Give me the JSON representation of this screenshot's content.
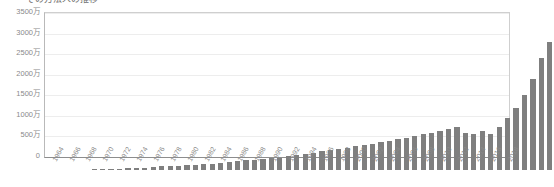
{
  "chart_data": {
    "type": "bar",
    "title": "その方法人の推移",
    "xlabel": "",
    "ylabel": "",
    "ylim": [
      0,
      3500
    ],
    "unit": "万",
    "grid": true,
    "legend": "none",
    "bar_color": "#7f7f7f",
    "y_ticks": [
      "0",
      "500万",
      "1000万",
      "1500万",
      "2000万",
      "2500万",
      "3000万",
      "3500万"
    ],
    "y_tick_values": [
      0,
      500,
      1000,
      1500,
      2000,
      2500,
      3000,
      3500
    ],
    "x_tick_labels": [
      "1964",
      "1966",
      "1968",
      "1970",
      "1972",
      "1974",
      "1976",
      "1978",
      "1980",
      "1982",
      "1984",
      "1986",
      "1988",
      "1990",
      "1992",
      "1994",
      "1996",
      "1998",
      "2000",
      "2002",
      "2004",
      "2006",
      "2008",
      "2010",
      "2012",
      "2014",
      "2016",
      "2018"
    ],
    "categories": [
      "1964",
      "1965",
      "1966",
      "1967",
      "1968",
      "1969",
      "1970",
      "1971",
      "1972",
      "1973",
      "1974",
      "1975",
      "1976",
      "1977",
      "1978",
      "1979",
      "1980",
      "1981",
      "1982",
      "1983",
      "1984",
      "1985",
      "1986",
      "1987",
      "1988",
      "1989",
      "1990",
      "1991",
      "1992",
      "1993",
      "1994",
      "1995",
      "1996",
      "1997",
      "1998",
      "1999",
      "2000",
      "2001",
      "2002",
      "2003",
      "2004",
      "2005",
      "2006",
      "2007",
      "2008",
      "2009",
      "2010",
      "2011",
      "2012",
      "2013",
      "2014",
      "2015",
      "2016",
      "2017",
      "2018"
    ],
    "values": [
      12,
      18,
      24,
      30,
      38,
      48,
      60,
      72,
      85,
      95,
      100,
      110,
      125,
      140,
      155,
      170,
      195,
      210,
      230,
      245,
      265,
      285,
      300,
      330,
      355,
      385,
      420,
      450,
      480,
      510,
      540,
      575,
      610,
      640,
      675,
      705,
      745,
      780,
      820,
      860,
      900,
      945,
      990,
      1030,
      900,
      860,
      945,
      860,
      1030,
      1250,
      1500,
      1800,
      2200,
      2700,
      3100
    ]
  }
}
